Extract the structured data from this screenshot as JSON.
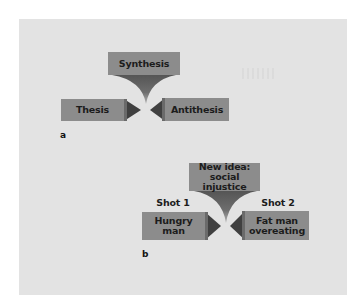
{
  "figure": {
    "panel_a": {
      "sublabel": "a",
      "top_box": {
        "label": "Synthesis"
      },
      "left_box": {
        "label": "Thesis"
      },
      "right_box": {
        "label": "Antithesis"
      }
    },
    "panel_b": {
      "sublabel": "b",
      "top_box": {
        "line1": "New idea:",
        "line2": "social injustice"
      },
      "left_caption": "Shot 1",
      "right_caption": "Shot 2",
      "left_box": {
        "line1": "Hungry",
        "line2": "man"
      },
      "right_box": {
        "line1": "Fat man",
        "line2": "overeating"
      }
    }
  },
  "colors": {
    "panel_bg": "#e3e3e3",
    "box_fill": "#8c8c8c",
    "arrow_fill": "#404040",
    "funnel_top": "#555555",
    "funnel_tip": "#b0b0b0",
    "text": "#1c1c1c"
  }
}
